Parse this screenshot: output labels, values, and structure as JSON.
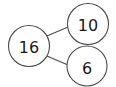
{
  "diagram": {
    "type": "number-bond",
    "whole": {
      "value": "16"
    },
    "parts": [
      {
        "value": "10"
      },
      {
        "value": "6"
      }
    ],
    "colors": {
      "stroke": "#4a4a4a",
      "text": "#1a1a1a",
      "background": "#ffffff"
    }
  }
}
